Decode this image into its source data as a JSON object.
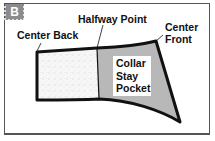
{
  "figure": {
    "panel_letter": "B",
    "labels": {
      "center_back": "Center Back",
      "halfway_point": "Halfway Point",
      "center_front": "Center Front",
      "center_front_line1": "Center",
      "center_front_line2": "Front",
      "pocket_line1": "Collar",
      "pocket_line2": "Stay",
      "pocket_line3": "Pocket"
    },
    "regions": [
      {
        "name": "back-half",
        "fill": "stippled",
        "color": "#f2f2f2"
      },
      {
        "name": "collar-stay-pocket",
        "fill": "solid",
        "color": "#b8b8b8"
      }
    ],
    "colors": {
      "outline": "#111111",
      "badge": "#8c8c8c",
      "pocket_fill": "#b8b8b8",
      "frame": "#555555"
    }
  }
}
